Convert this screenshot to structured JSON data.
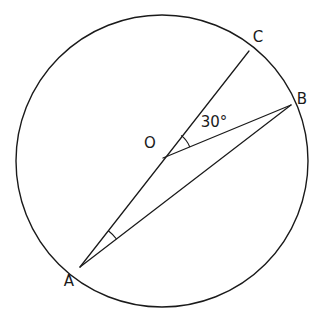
{
  "figure": {
    "background_color": "#ffffff",
    "stroke_color": "#1a1a1a"
  },
  "circle": {
    "center_x": 162,
    "center_y": 161,
    "radius": 146,
    "label": "circle"
  },
  "points": {
    "O": {
      "name": "O",
      "label": "O",
      "x": 163,
      "y": 158,
      "label_x": 150,
      "label_y": 143
    },
    "A": {
      "name": "A",
      "label": "A",
      "x": 80,
      "y": 267,
      "label_x": 69,
      "label_y": 281
    },
    "B": {
      "name": "B",
      "label": "B",
      "x": 291,
      "y": 105,
      "label_x": 302,
      "label_y": 99
    },
    "C": {
      "name": "C",
      "label": "C",
      "x": 249,
      "y": 51,
      "label_x": 258,
      "label_y": 37
    }
  },
  "segments": [
    {
      "name": "segment-AC",
      "from": "A",
      "to": "C"
    },
    {
      "name": "segment-OB",
      "from": "O",
      "to": "B"
    },
    {
      "name": "segment-AB",
      "from": "A",
      "to": "B"
    }
  ],
  "angles": [
    {
      "name": "central-angle-BOC",
      "vertex": "O",
      "label": "30°",
      "value": 30,
      "unit": "degrees",
      "label_x": 214,
      "label_y": 122,
      "arc_radius": 29
    },
    {
      "name": "inscribed-angle-CAB",
      "vertex": "A",
      "label": "",
      "value": 15,
      "unit": "degrees",
      "arc_radius": 46
    }
  ],
  "chart_data": {
    "type": "diagram",
    "elements": [
      "circle centered at O",
      "diameter A to C through O",
      "radius O to B",
      "chord A to B",
      "angle arc at O labeled 30°",
      "angle arc at A unlabeled"
    ],
    "labels": [
      "O",
      "A",
      "B",
      "C",
      "30°"
    ]
  }
}
